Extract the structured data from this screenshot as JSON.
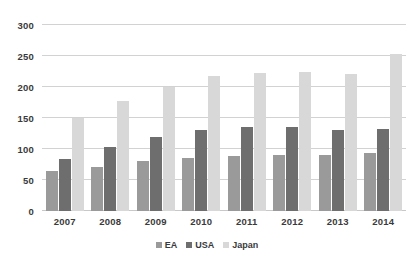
{
  "chart_data": {
    "type": "bar",
    "title": "",
    "subtitle": "",
    "xlabel": "",
    "ylabel": "",
    "categories": [
      "2007",
      "2008",
      "2009",
      "2010",
      "2011",
      "2012",
      "2013",
      "2014"
    ],
    "series": [
      {
        "name": "EA",
        "color": "#9a9a9a",
        "values": [
          65,
          71,
          80,
          85,
          88,
          90,
          91,
          94
        ]
      },
      {
        "name": "USA",
        "color": "#6e6e6e",
        "values": [
          84,
          103,
          120,
          130,
          135,
          136,
          130,
          132
        ]
      },
      {
        "name": "Japan",
        "color": "#d8d8d8",
        "values": [
          150,
          177,
          200,
          217,
          222,
          225,
          221,
          253
        ]
      }
    ],
    "ylim": [
      0,
      300
    ],
    "yticks": [
      0,
      50,
      100,
      150,
      200,
      250,
      300
    ],
    "ytick_labels": [
      "0",
      "50",
      "100",
      "150",
      "200",
      "250",
      "300"
    ],
    "grid": true,
    "legend_position": "bottom",
    "annotations": []
  }
}
